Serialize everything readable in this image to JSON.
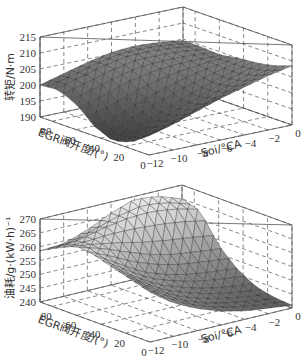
{
  "chart_data": [
    {
      "type": "surface3d",
      "title": "",
      "xlabel": "Soi/°CA",
      "ylabel": "EGR阀开度/(°)",
      "zlabel": "转矩/N·m",
      "x_ticks": [
        "-12",
        "-10",
        "-8",
        "-6",
        "-4",
        "-2",
        "0"
      ],
      "y_ticks": [
        "0",
        "20",
        "40",
        "60",
        "80"
      ],
      "z_ticks": [
        "190",
        "195",
        "200",
        "205",
        "210",
        "215"
      ],
      "xlim": [
        -12,
        0
      ],
      "ylim": [
        0,
        90
      ],
      "zlim": [
        190,
        215
      ],
      "grid": true,
      "colormap": "gray",
      "x": [
        -12,
        -10,
        -8,
        -6,
        -4,
        -2,
        0
      ],
      "y": [
        0,
        15,
        30,
        45,
        60,
        75,
        90
      ],
      "z": [
        [
          196,
          198,
          200.5,
          203,
          205,
          207,
          208.5
        ],
        [
          192,
          194,
          196.5,
          199,
          202,
          204.5,
          206.5
        ],
        [
          190.5,
          192,
          195,
          198,
          201,
          203.5,
          205.5
        ],
        [
          193,
          195,
          198,
          200.5,
          202.5,
          204,
          205
        ],
        [
          198,
          200,
          202.5,
          204,
          204.5,
          204.5,
          204
        ],
        [
          200.5,
          202.5,
          204.5,
          206,
          206,
          205.5,
          204.5
        ],
        [
          200,
          202,
          204,
          205.5,
          206,
          205.5,
          204.5
        ]
      ]
    },
    {
      "type": "surface3d",
      "title": "",
      "xlabel": "Soi/°CA",
      "ylabel": "EGR阀开度/(°)",
      "zlabel": "油耗/g·(kW·h)⁻¹",
      "x_ticks": [
        "-12",
        "-10",
        "-8",
        "-6",
        "-4",
        "-2",
        "0"
      ],
      "y_ticks": [
        "0",
        "20",
        "40",
        "60",
        "80"
      ],
      "z_ticks": [
        "240",
        "245",
        "250",
        "255",
        "260",
        "265",
        "270"
      ],
      "xlim": [
        -12,
        0
      ],
      "ylim": [
        0,
        90
      ],
      "zlim": [
        240,
        270
      ],
      "grid": true,
      "colormap": "gray",
      "x": [
        -12,
        -10,
        -8,
        -6,
        -4,
        -2,
        0
      ],
      "y": [
        0,
        15,
        30,
        45,
        60,
        75,
        90
      ],
      "z": [
        [
          258,
          252,
          248,
          245,
          243,
          242,
          241
        ],
        [
          260,
          254,
          249,
          246,
          244,
          242.5,
          241.5
        ],
        [
          262,
          256,
          251,
          248,
          245.5,
          244,
          243
        ],
        [
          264,
          259,
          254,
          251,
          249,
          248,
          247
        ],
        [
          265,
          263,
          260,
          257,
          255,
          254,
          253
        ],
        [
          262,
          263,
          265,
          266,
          266,
          265,
          263
        ],
        [
          258.5,
          259,
          262,
          266,
          269,
          268,
          265
        ]
      ]
    }
  ],
  "charts": [
    {
      "zlabel": "转矩/N·m",
      "ylabel": "EGR阀开度/(°)",
      "xlabel": "Soi/°CA"
    },
    {
      "zlabel": "油耗/g·(kW·h)⁻¹",
      "ylabel": "EGR阀开度/(°)",
      "xlabel": "Soi/°CA"
    }
  ]
}
